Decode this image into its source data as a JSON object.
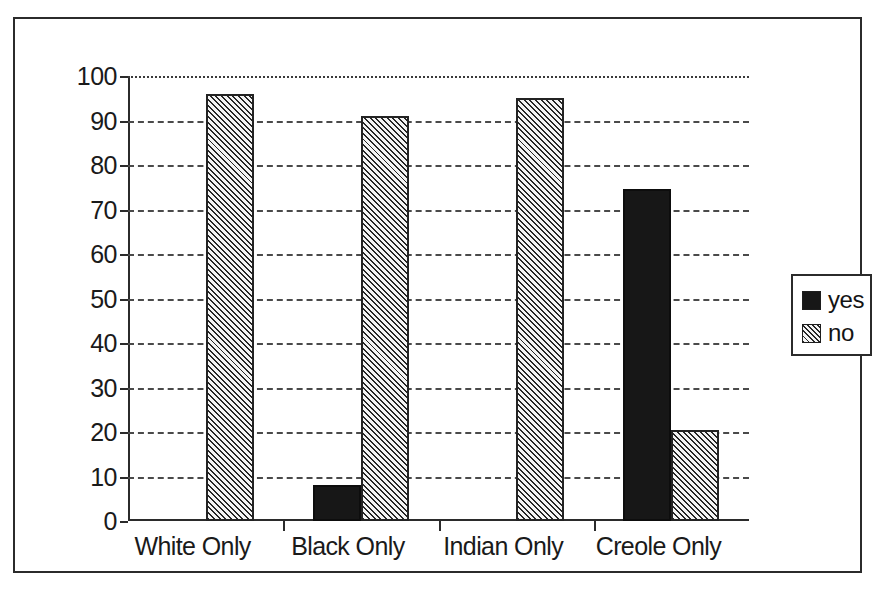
{
  "chart_data": {
    "type": "bar",
    "title": "",
    "xlabel": "",
    "ylabel": "",
    "categories": [
      "White Only",
      "Black Only",
      "Indian Only",
      "Creole Only"
    ],
    "series": [
      {
        "name": "yes",
        "values": [
          0,
          8,
          0,
          74.5
        ],
        "fill": "solid-black",
        "color": "#171717"
      },
      {
        "name": "no",
        "values": [
          96,
          91,
          95,
          20.5
        ],
        "fill": "diagonal-hatch",
        "color": "#f2f2f2"
      }
    ],
    "ylim": [
      0,
      100
    ],
    "ytick_labels": [
      "0",
      "10",
      "20",
      "30",
      "40",
      "50",
      "60",
      "70",
      "80",
      "90",
      "100"
    ],
    "ytick_values": [
      0,
      10,
      20,
      30,
      40,
      50,
      60,
      70,
      80,
      90,
      100
    ],
    "grid": "horizontal-dashed",
    "legend_position": "right",
    "legend_entries": [
      "yes",
      "no"
    ],
    "frame": "outer-rectangle-border"
  }
}
